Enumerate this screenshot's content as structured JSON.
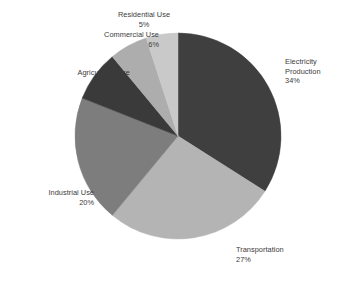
{
  "chart_data": {
    "type": "pie",
    "title": "",
    "subtitle": "",
    "xlabel": "",
    "ylabel": "",
    "legend_position": "none",
    "labels_position": "outside",
    "grid": false,
    "start_angle_deg": 0,
    "direction": "clockwise",
    "unit": "%",
    "categories": [
      "Electricity Production",
      "Transportation",
      "Industrial Use",
      "Agricultural Use",
      "Commercial Use",
      "Residential Use"
    ],
    "values": [
      34,
      27,
      20,
      8,
      6,
      5
    ],
    "colors": [
      "#3f3f3f",
      "#b4b4b4",
      "#7d7d7d",
      "#3a3a3a",
      "#adadad",
      "#c9c9c9"
    ],
    "slices": [
      {
        "name": "Electricity Production",
        "name_line1": "Electricity",
        "name_line2": "Production",
        "value": 34,
        "value_label": "34%",
        "color": "#3f3f3f"
      },
      {
        "name": "Transportation",
        "name_line1": "Transportation",
        "name_line2": "",
        "value": 27,
        "value_label": "27%",
        "color": "#b4b4b4"
      },
      {
        "name": "Industrial Use",
        "name_line1": "Industrial Use",
        "name_line2": "",
        "value": 20,
        "value_label": "20%",
        "color": "#7d7d7d"
      },
      {
        "name": "Agricultural Use",
        "name_line1": "Agricultural Use",
        "name_line2": "",
        "value": 8,
        "value_label": "8%",
        "color": "#3a3a3a"
      },
      {
        "name": "Commercial Use",
        "name_line1": "Commercial Use",
        "name_line2": "",
        "value": 6,
        "value_label": "6%",
        "color": "#adadad"
      },
      {
        "name": "Residential Use",
        "name_line1": "Residential Use",
        "name_line2": "",
        "value": 5,
        "value_label": "5%",
        "color": "#c9c9c9"
      }
    ]
  },
  "geometry": {
    "center_x": 178,
    "center_y": 136,
    "radius": 103
  },
  "background_color": "#ffffff",
  "label_text_color": "#3b3b3b"
}
